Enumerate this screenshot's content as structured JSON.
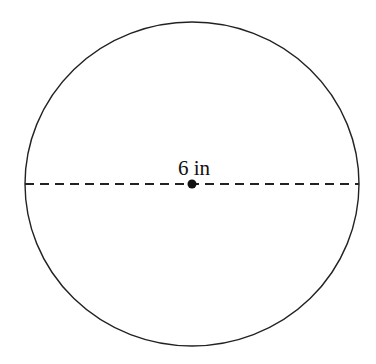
{
  "diagram": {
    "shape": "circle",
    "diameter_label": "6 in",
    "colors": {
      "stroke": "#222222",
      "background": "#ffffff"
    },
    "geometry": {
      "cx": 192,
      "cy": 184,
      "rx": 167,
      "ry": 162
    }
  }
}
